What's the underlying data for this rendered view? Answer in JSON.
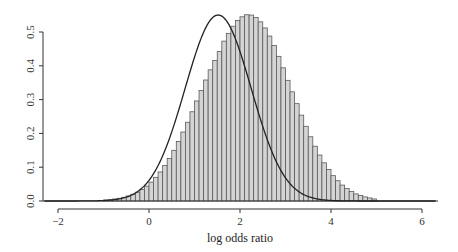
{
  "chart_data": {
    "type": "bar",
    "subtype": "histogram-with-density-curve",
    "title": "",
    "xlabel": "log odds ratio",
    "ylabel": "",
    "xlim": [
      -2.3,
      6.3
    ],
    "ylim": [
      0,
      0.55
    ],
    "x_ticks": [
      -2,
      0,
      2,
      4,
      6
    ],
    "x_tick_labels": [
      "−2",
      "0",
      "2",
      "4",
      "6"
    ],
    "y_ticks": [
      0.0,
      0.1,
      0.2,
      0.3,
      0.4,
      0.5
    ],
    "y_tick_labels": [
      "0.0",
      "0.1",
      "0.2",
      "0.3",
      "0.4",
      "0.5"
    ],
    "grid": false,
    "legend": null,
    "bin_width": 0.1,
    "bin_start": -1.0,
    "values": [
      0.003,
      0.004,
      0.006,
      0.008,
      0.011,
      0.015,
      0.02,
      0.026,
      0.034,
      0.044,
      0.056,
      0.07,
      0.086,
      0.105,
      0.126,
      0.15,
      0.176,
      0.204,
      0.233,
      0.264,
      0.296,
      0.327,
      0.358,
      0.388,
      0.416,
      0.442,
      0.473,
      0.496,
      0.517,
      0.534,
      0.545,
      0.551,
      0.55,
      0.543,
      0.53,
      0.512,
      0.488,
      0.46,
      0.428,
      0.394,
      0.357,
      0.323,
      0.288,
      0.254,
      0.221,
      0.19,
      0.162,
      0.136,
      0.113,
      0.093,
      0.075,
      0.06,
      0.047,
      0.037,
      0.028,
      0.021,
      0.016,
      0.012,
      0.009,
      0.006
    ],
    "density_curve": {
      "distribution": "normal",
      "mean": 1.52,
      "sd": 0.725
    },
    "colors": {
      "bar_fill": "#d4d4d4",
      "bar_stroke": "#5a5a5a",
      "curve": "#222222",
      "axis": "#333333"
    }
  }
}
